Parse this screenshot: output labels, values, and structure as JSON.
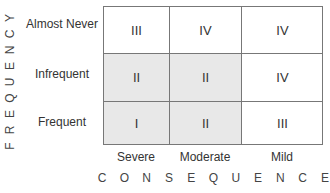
{
  "diagram": {
    "y_axis_title": "FREQUENCY",
    "x_axis_title": "CONSEQUENCE",
    "rows": [
      "Almost Never",
      "Infrequent",
      "Frequent"
    ],
    "columns": [
      "Severe",
      "Moderate",
      "Mild"
    ],
    "cells": [
      [
        {
          "value": "III",
          "shaded": false
        },
        {
          "value": "IV",
          "shaded": false
        },
        {
          "value": "IV",
          "shaded": false
        }
      ],
      [
        {
          "value": "II",
          "shaded": true
        },
        {
          "value": "II",
          "shaded": true
        },
        {
          "value": "IV",
          "shaded": false
        }
      ],
      [
        {
          "value": "I",
          "shaded": true
        },
        {
          "value": "II",
          "shaded": true
        },
        {
          "value": "III",
          "shaded": false
        }
      ]
    ],
    "colors": {
      "shaded": "#e8e8e8",
      "border": "#777777",
      "text": "#333333"
    }
  }
}
